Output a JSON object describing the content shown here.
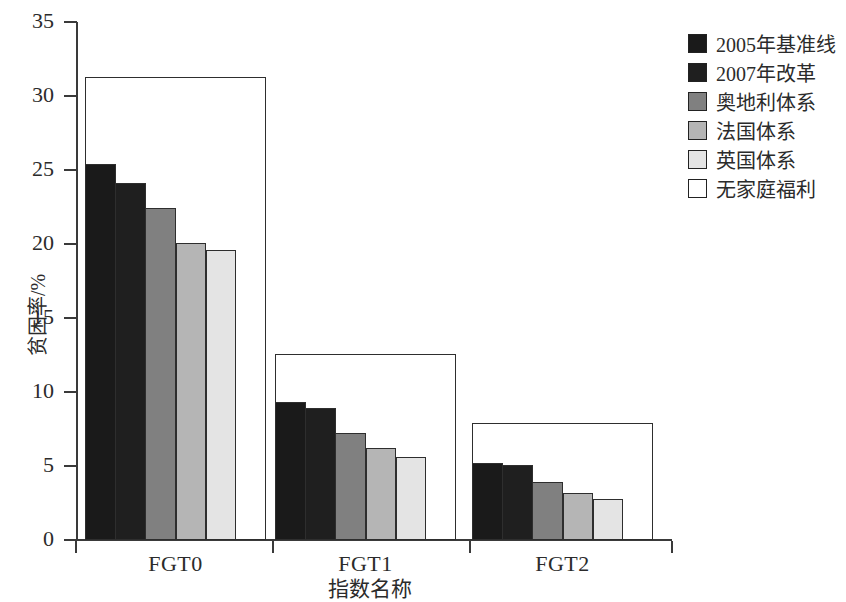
{
  "chart_data": {
    "type": "bar",
    "title": "",
    "xlabel": "指数名称",
    "ylabel": "贫困率/%",
    "categories": [
      "FGT0",
      "FGT1",
      "FGT2"
    ],
    "ylim": [
      0,
      35
    ],
    "yticks": [
      0,
      5,
      10,
      15,
      20,
      25,
      30,
      35
    ],
    "ytick_labels": [
      "0",
      "5",
      "10",
      "15",
      "20",
      "25",
      "30",
      "35"
    ],
    "grid": false,
    "legend_position": "right",
    "series": [
      {
        "name": "2005年基准线",
        "color": "#1a1a1a",
        "values": [
          25.4,
          9.3,
          5.2
        ]
      },
      {
        "name": "2007年改革",
        "color": "#1f1f1f",
        "values": [
          24.1,
          8.9,
          5.1
        ]
      },
      {
        "name": "奥地利体系",
        "color": "#808080",
        "values": [
          22.4,
          7.2,
          3.9
        ]
      },
      {
        "name": "法国体系",
        "color": "#b5b5b5",
        "values": [
          20.1,
          6.2,
          3.2
        ]
      },
      {
        "name": "英国体系",
        "color": "#e4e4e4",
        "values": [
          19.6,
          5.6,
          2.8
        ]
      },
      {
        "name": "无家庭福利",
        "color": "#ffffff",
        "values": [
          31.3,
          12.6,
          7.9
        ]
      }
    ]
  },
  "legend": {
    "items": [
      {
        "label": "2005年基准线",
        "swatch": "#1a1a1a"
      },
      {
        "label": "2007年改革",
        "swatch": "#1f1f1f"
      },
      {
        "label": "奥地利体系",
        "swatch": "#808080"
      },
      {
        "label": "法国体系",
        "swatch": "#b5b5b5"
      },
      {
        "label": "英国体系",
        "swatch": "#e4e4e4"
      },
      {
        "label": "无家庭福利",
        "swatch": "#ffffff"
      }
    ]
  }
}
